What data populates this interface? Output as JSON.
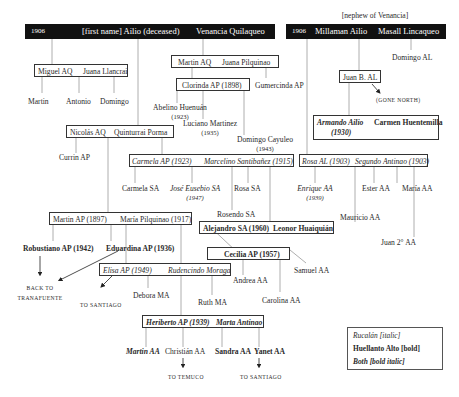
{
  "header": {
    "left_bar": {
      "year": "1906",
      "person1": "[first name] Ailio (deceased)",
      "person2": "Venancia Quilaqueo"
    },
    "right_bar": {
      "note": "[nephew of Venancia]",
      "year": "1906",
      "person1": "Millaman Ailio",
      "person2": "Masall Lincaqueo"
    }
  },
  "couples": {
    "miguel": {
      "a": "Miguel AQ",
      "b": "Juana Llancrai"
    },
    "martin_aq": {
      "a": "Martin AQ",
      "b": "Juana Pilquinao"
    },
    "clorinda": {
      "a": "Clorinda AP (1898)"
    },
    "nicolas": {
      "a": "Nicolás AQ",
      "b": "Quinturrai Porma"
    },
    "carmela": {
      "a": "Carmela AP (1923)",
      "b": "Marcelino Santibañez (1915)"
    },
    "juan_b": {
      "a": "Juan B. AL"
    },
    "armando": {
      "a": "Armando Ailio",
      "a_year": "(1930)",
      "b": "Carmen Huentemilla"
    },
    "rosa": {
      "a": "Rosa AL (1903)",
      "b": "Segundo Antinao (1903)"
    },
    "alejandro": {
      "a": "Alejandro SA (1960)",
      "b": "Leonor Huaiquián"
    },
    "martin_ap": {
      "a": "Martin AP (1897)",
      "b": "María Pilquinao (1917)"
    },
    "cecilia": {
      "a": "Cecilia AP (1957)"
    },
    "elisa": {
      "a": "Elisa AP (1949)",
      "b": "Rudencindo Moraga"
    },
    "heriberto": {
      "a": "Heriberto AP (1939)",
      "b": "Marta Antinao"
    }
  },
  "people": {
    "martin": "Martin",
    "antonio": "Antonio",
    "domingo": "Domingo",
    "gumercinda": "Gumercinda AP",
    "abelino": "Abelino Huenuán",
    "abelino_year": "(1923)",
    "luciano": "Luciano Martinez",
    "luciano_year": "(1935)",
    "domingo_cayuleo": "Domingo Cayuleo",
    "domingo_cayuleo_year": "(1943)",
    "currin": "Currin AP",
    "domingo_al": "Domingo AL",
    "carmela_sa": "Carmela SA",
    "jose": "José Eusebio SA",
    "jose_year": "(1947)",
    "rosa_sa": "Rosa SA",
    "rosendo": "Rosendo SA",
    "enrique": "Enrique AA",
    "enrique_year": "(1939)",
    "ester": "Ester AA",
    "maria_aa": "María AA",
    "mauricio": "Mauricio AA",
    "juan2": "Juan 2° AA",
    "robustiano": "Robustiano AP (1942)",
    "eduardina": "Eduardina AP (1936)",
    "samuel": "Samuel AA",
    "andrea": "Andrea AA",
    "carolina": "Carolina AA",
    "debora": "Debora MA",
    "ruth": "Ruth MA",
    "martin_aa": "Martin AA",
    "christian": "Christián AA",
    "sandra": "Sandra AA",
    "yanet": "Yanet AA"
  },
  "destinations": {
    "gone_north": "(gone north)",
    "back_to_1": "back to",
    "back_to_2": "tranafuente",
    "to_santiago_1": "to santiago",
    "to_temuco": "to temuco",
    "to_santiago_2": "to santiago"
  },
  "legend": {
    "italic": "Rucalán  [italic]",
    "bold": "Huellanto Alto  [bold]",
    "both": "Both  [bold italic]"
  },
  "colors": {
    "bar": "#111111",
    "line": "#888888",
    "text": "#2a2a2a"
  }
}
